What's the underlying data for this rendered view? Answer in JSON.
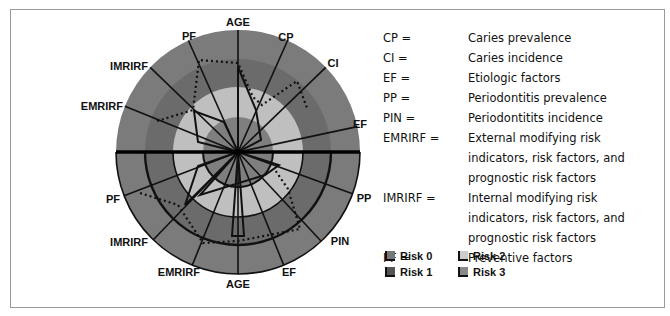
{
  "chart_data": {
    "type": "radar",
    "title": "",
    "center": [
      238,
      152
    ],
    "ring_radii": [
      35,
      65,
      93,
      122
    ],
    "risk_levels": [
      "Risk 3",
      "Risk 2",
      "Risk 1",
      "Risk 0"
    ],
    "upper_half": {
      "axes": [
        {
          "label": "AGE",
          "angle": 90
        },
        {
          "label": "CP",
          "angle": 66
        },
        {
          "label": "CI",
          "angle": 44
        },
        {
          "label": "EF",
          "angle": 12
        },
        {
          "label": "PF",
          "angle": 114
        },
        {
          "label": "IMRIRF",
          "angle": 136
        },
        {
          "label": "EMRIRF",
          "angle": 158
        }
      ],
      "solid_polygon": [
        [
          238,
          152
        ],
        [
          238,
          67
        ],
        [
          256,
          110
        ],
        [
          261,
          140
        ],
        [
          238,
          152
        ],
        [
          224,
          122
        ],
        [
          194,
          111
        ],
        [
          198,
          142
        ],
        [
          238,
          152
        ]
      ],
      "dashed_polygon": [
        [
          157,
          121
        ],
        [
          193,
          110
        ],
        [
          199,
          60
        ],
        [
          238,
          63
        ],
        [
          253,
          97
        ],
        [
          262,
          105
        ],
        [
          297,
          81
        ],
        [
          307,
          108
        ]
      ]
    },
    "lower_half": {
      "axes": [
        {
          "label": "AGE",
          "angle": 270
        },
        {
          "label": "EF",
          "angle": 292
        },
        {
          "label": "PIN",
          "angle": 313
        },
        {
          "label": "PP",
          "angle": 340
        },
        {
          "label": "PF",
          "angle": 201
        },
        {
          "label": "IMRIRF",
          "angle": 226
        },
        {
          "label": "EMRIRF",
          "angle": 248
        }
      ],
      "solid_polygon": [
        [
          238,
          152
        ],
        [
          198,
          166
        ],
        [
          185,
          205
        ],
        [
          238,
          152
        ],
        [
          232,
          236
        ],
        [
          238,
          236
        ],
        [
          244,
          236
        ],
        [
          238,
          152
        ],
        [
          200,
          195
        ],
        [
          265,
          175
        ],
        [
          279,
          165
        ],
        [
          238,
          152
        ]
      ],
      "dashed_polygon": [
        [
          140,
          193
        ],
        [
          178,
          205
        ],
        [
          203,
          243
        ],
        [
          238,
          241
        ],
        [
          300,
          229
        ],
        [
          288,
          189
        ],
        [
          275,
          170
        ]
      ]
    }
  },
  "labels": {
    "top": {
      "age": "AGE",
      "cp": "CP",
      "ci": "CI",
      "ef": "EF",
      "pf": "PF",
      "imrirf": "IMRIRF",
      "emrirf": "EMRIRF"
    },
    "bottom": {
      "age": "AGE",
      "ef": "EF",
      "pin": "PIN",
      "pp": "PP",
      "pf": "PF",
      "imrirf": "IMRIRF",
      "emrirf": "EMRIRF"
    }
  },
  "abbreviations": [
    {
      "key": "CP =",
      "value": "Caries prevalence"
    },
    {
      "key": "CI =",
      "value": "Caries incidence"
    },
    {
      "key": "EF =",
      "value": "Etiologic factors"
    },
    {
      "key": "PP =",
      "value": "Periodontitis prevalence"
    },
    {
      "key": "PIN =",
      "value": "Periodontitits incidence"
    },
    {
      "key": "EMRIRF =",
      "value": "External modifying risk indicators, risk factors, and prognostic risk factors"
    },
    {
      "key": "IMRIRF =",
      "value": "Internal modifying risk indicators, risk factors, and prognostic risk factors"
    },
    {
      "key": "PF =",
      "value": "Preventive factors"
    }
  ],
  "legend": [
    {
      "label": "Risk 0",
      "color": "#777777"
    },
    {
      "label": "Risk 2",
      "color": "#cccccc"
    },
    {
      "label": "Risk 1",
      "color": "#555555"
    },
    {
      "label": "Risk 3",
      "color": "#888888"
    }
  ],
  "colors": {
    "outer_ring": "#7b7b7b",
    "ring2": "#6b6b6b",
    "ring3": "#bfbfbf",
    "inner": "#7f7f7f"
  }
}
